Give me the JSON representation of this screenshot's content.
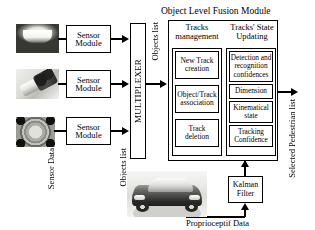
{
  "diagram": {
    "title": "Object Level Fusion Module",
    "sensors": [
      {
        "image_name": "camera-sensor-image",
        "module_label": "Sensor\nModule"
      },
      {
        "image_name": "lidar-sensor-image",
        "module_label": "Sensor\nModule"
      },
      {
        "image_name": "radar-sensor-image",
        "module_label": "Sensor\nModule"
      }
    ],
    "sensor_data_label": "Sensor Data",
    "multiplexer_label": "MULTIPLEXER",
    "objects_list_label": "Objects list",
    "columns": [
      {
        "header": "Tracks\nmanagement",
        "items": [
          "New Track\ncreation",
          "Object/Track\nassociation",
          "Track\ndeletion"
        ]
      },
      {
        "header": "Tracks' State\nUpdating",
        "items": [
          "Detection and\nrecognition\nconfidences",
          "Dimension",
          "Kinematical\nstate",
          "Tracking\nConfidence"
        ]
      }
    ],
    "kalman_label": "Kalman\nFilter",
    "proprioceptif_label": "Proprioceptif Data",
    "output_label": "Selected Pedestrian list",
    "vehicle_image_name": "vehicle-photo",
    "colors": {
      "line": "#000000",
      "background": "#ffffff",
      "text": "#000000"
    }
  }
}
